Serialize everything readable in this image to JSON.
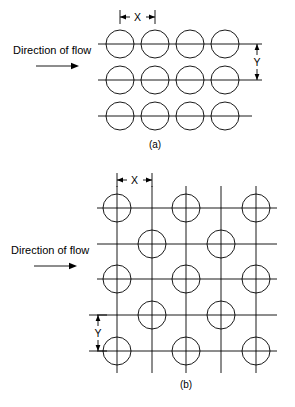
{
  "figure": {
    "background_color": "#ffffff",
    "line_color": "#000000",
    "width": 295,
    "height": 407
  },
  "panels": [
    {
      "id": "a",
      "caption": "(a)",
      "arrangement": "in-line",
      "flow_label": "Direction of flow",
      "flow_arrow_icon": "right-arrow-icon",
      "dimensions": [
        {
          "name": "X",
          "label": "X",
          "orientation": "horizontal",
          "meaning": "transverse tube pitch"
        },
        {
          "name": "Y",
          "label": "Y",
          "orientation": "vertical",
          "meaning": "longitudinal tube pitch"
        }
      ],
      "geometry": {
        "rows": 3,
        "columns": 4,
        "circle_radius": 14,
        "column_centers_x": [
          120,
          155,
          190,
          225
        ],
        "row_centers_y": [
          44,
          80,
          116
        ],
        "line_start_x": 98,
        "line_end_x": 252,
        "x_dim_from": 120,
        "x_dim_to": 155,
        "x_dim_y": 17,
        "y_dim_x": 243,
        "y_dim_from": 44,
        "y_dim_to": 80
      }
    },
    {
      "id": "b",
      "caption": "(b)",
      "arrangement": "staggered",
      "flow_label": "Direction of flow",
      "flow_arrow_icon": "right-arrow-icon",
      "dimensions": [
        {
          "name": "X",
          "label": "X",
          "orientation": "horizontal",
          "meaning": "transverse tube pitch"
        },
        {
          "name": "Y",
          "label": "Y",
          "orientation": "vertical",
          "meaning": "longitudinal tube pitch"
        }
      ],
      "geometry": {
        "horizontal_lines_y": [
          208,
          244,
          279,
          315,
          351
        ],
        "vertical_lines_x": [
          117,
          152,
          186,
          221,
          256
        ],
        "h_line_start_x": 97,
        "h_line_end_x": 277,
        "v_line_start_y": 186,
        "v_line_end_y": 373,
        "circle_radius": 14,
        "circles": [
          {
            "cx": 117,
            "cy": 208
          },
          {
            "cx": 186,
            "cy": 208
          },
          {
            "cx": 256,
            "cy": 208
          },
          {
            "cx": 152,
            "cy": 244
          },
          {
            "cx": 221,
            "cy": 244
          },
          {
            "cx": 117,
            "cy": 279
          },
          {
            "cx": 186,
            "cy": 279
          },
          {
            "cx": 256,
            "cy": 279
          },
          {
            "cx": 152,
            "cy": 315
          },
          {
            "cx": 221,
            "cy": 315
          },
          {
            "cx": 117,
            "cy": 351
          },
          {
            "cx": 186,
            "cy": 351
          },
          {
            "cx": 256,
            "cy": 351
          }
        ],
        "x_dim_from": 117,
        "x_dim_to": 152,
        "x_dim_y": 180,
        "y_dim_x": 98,
        "y_dim_from": 315,
        "y_dim_to": 351
      }
    }
  ],
  "labels": {
    "x_label": "X",
    "y_label": "Y",
    "flow_text": "Direction of flow",
    "caption_a": "(a)",
    "caption_b": "(b)"
  }
}
